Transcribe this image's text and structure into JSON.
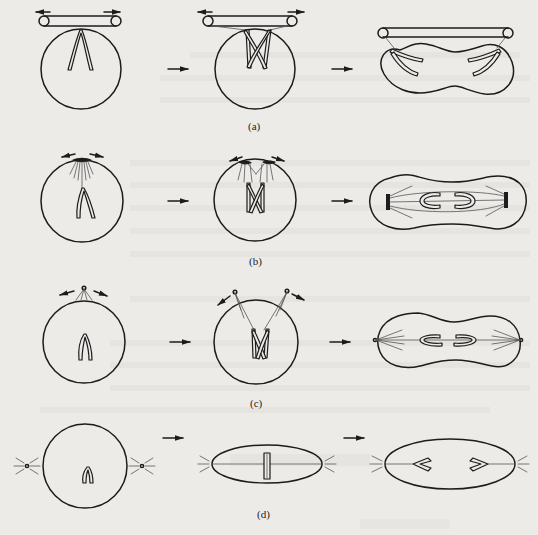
{
  "figure": {
    "panels": [
      {
        "id": "a",
        "label": "(a)",
        "description": "Extranuclear spindle (bar) — chromosomes attached to external spindle; nucleus elongates into dumbbell"
      },
      {
        "id": "b",
        "label": "(b)",
        "description": "Polar caps on nuclear envelope; intranuclear spindle forms; chromosomes separate in dumbbell nucleus"
      },
      {
        "id": "c",
        "label": "(c)",
        "description": "Centrioles outside nuclear envelope; fibres penetrate envelope; dumbbell nucleus with polar asters"
      },
      {
        "id": "d",
        "label": "(d)",
        "description": "Asters outside nucleus; envelope breaks down; metaphase plate in spindle; anaphase separation"
      }
    ],
    "arrow_glyph": "right-arrow",
    "colors": {
      "ink": "#1c1c1c",
      "paper": "#ecebe8",
      "fibre": "#555555"
    }
  }
}
